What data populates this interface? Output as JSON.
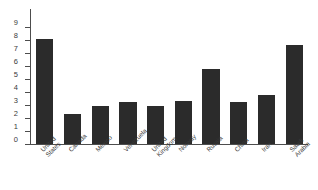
{
  "chart_data": {
    "type": "bar",
    "title": "",
    "subtitle": "",
    "xlabel": "",
    "ylabel": "",
    "categories": [
      "United States",
      "Canada",
      "Mexico",
      "Venezuela",
      "United Kingdom",
      "Norway",
      "Russia",
      "China",
      "Iran",
      "Saudi Arabia"
    ],
    "category_lines": [
      [
        "United",
        "States"
      ],
      [
        "Canada"
      ],
      [
        "Mexico"
      ],
      [
        "Venezuela"
      ],
      [
        "United",
        "Kingdom"
      ],
      [
        "Norway"
      ],
      [
        "Russia"
      ],
      [
        "China"
      ],
      [
        "Iran"
      ],
      [
        "Saudi",
        "Arabia"
      ]
    ],
    "values": [
      8.1,
      2.3,
      2.9,
      3.2,
      2.9,
      3.3,
      5.8,
      3.25,
      3.75,
      7.6
    ],
    "ylim": [
      0,
      9
    ],
    "ytick_labels": [
      "0",
      "1",
      "2",
      "3",
      "4",
      "5",
      "6",
      "7",
      "8",
      "9"
    ],
    "ytick_values": [
      0,
      1,
      2,
      3,
      4,
      5,
      6,
      7,
      8,
      9
    ],
    "grid": false,
    "legend": null,
    "bar_color": "#2b2b2b",
    "axis_color": "#4d4d4d",
    "text_color": "#3a3a3a",
    "background_color": "#ffffff"
  }
}
